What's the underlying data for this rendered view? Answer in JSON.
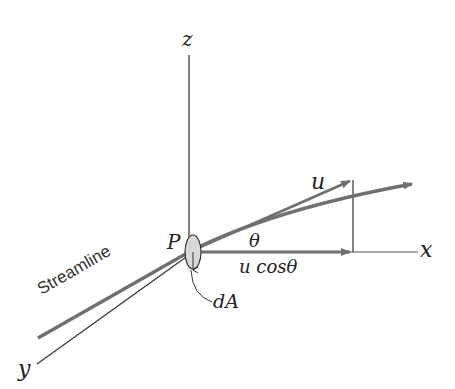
{
  "diagram": {
    "labels": {
      "z_axis": "z",
      "x_axis": "x",
      "y_axis": "y",
      "point": "P",
      "velocity": "u",
      "angle": "θ",
      "component": "u cosθ",
      "area": "dA",
      "streamline": "Streamline"
    },
    "colors": {
      "arrow": "#707070",
      "axis": "#333333",
      "area_fill": "#d8d8d8"
    }
  }
}
